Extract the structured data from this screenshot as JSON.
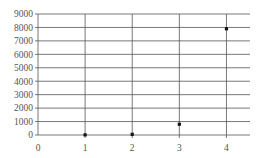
{
  "chart_data": {
    "type": "scatter",
    "title": "",
    "xlabel": "",
    "ylabel": "",
    "x": [
      1,
      2,
      3,
      4
    ],
    "y": [
      10,
      50,
      800,
      7900
    ],
    "series": [
      {
        "name": "",
        "x": [
          1,
          2,
          3,
          4
        ],
        "values": [
          10,
          50,
          800,
          7900
        ]
      }
    ],
    "xlim": [
      0,
      4.5
    ],
    "ylim": [
      0,
      9000
    ],
    "x_ticks": [
      "0",
      "1",
      "2",
      "3",
      "4"
    ],
    "y_ticks": [
      "0",
      "1000",
      "2000",
      "3000",
      "4000",
      "5000",
      "6000",
      "7000",
      "8000",
      "9000"
    ],
    "grid": true,
    "legend": "none"
  },
  "colors": {
    "grid": "#555555",
    "marker": "#111111",
    "text": "#555555"
  }
}
